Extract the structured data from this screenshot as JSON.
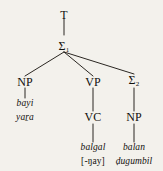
{
  "figure": {
    "kind": "syntax-tree",
    "background_color": "#f3f1ec",
    "ink_color": "#12100d"
  },
  "nodes": {
    "root": {
      "label": "T"
    },
    "sigma1": {
      "label": "Σ",
      "subscript": "1"
    },
    "np1": {
      "label": "NP"
    },
    "vp": {
      "label": "VP"
    },
    "sigma2": {
      "label": "Σ",
      "subscript": "2"
    },
    "vc": {
      "label": "VC"
    },
    "np2": {
      "label": "NP"
    }
  },
  "terminals": {
    "np1": {
      "line1": "bayi",
      "line2": "yaṟa"
    },
    "vc": {
      "line1": "balgal",
      "line2": "[-ŋay]"
    },
    "np2": {
      "line1": "balan",
      "line2": "ḍugumbil"
    }
  }
}
